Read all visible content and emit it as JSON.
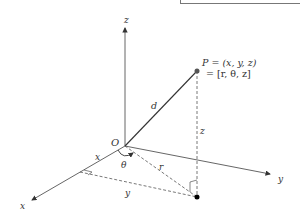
{
  "diagram": {
    "axes": {
      "x_label": "x",
      "y_label": "y",
      "z_label": "z"
    },
    "origin_label": "O",
    "point": {
      "cartesian_line": "P = (x, y, z)",
      "cylindrical_line": "= [r, θ, z]"
    },
    "segment_labels": {
      "d": "d",
      "r": "r",
      "z": "z",
      "x": "x",
      "y": "y",
      "theta": "θ"
    },
    "colors": {
      "axis": "#555555",
      "line": "#333333",
      "point": "#444444",
      "foot_point": "#000000"
    }
  }
}
